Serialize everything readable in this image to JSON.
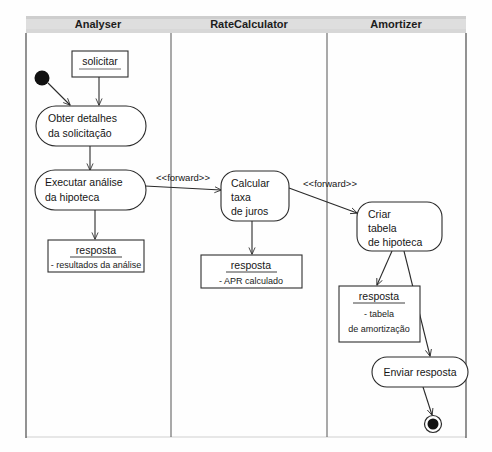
{
  "diagram": {
    "type": "uml-activity-diagram",
    "title": "",
    "language": "pt-BR",
    "lanes": [
      {
        "id": "analyser",
        "label": "Analyser",
        "x_center": 98
      },
      {
        "id": "ratecalculator",
        "label": "RateCalculator",
        "x_center": 249
      },
      {
        "id": "amortizer",
        "label": "Amortizer",
        "x_center": 396
      }
    ],
    "nodes": [
      {
        "id": "start",
        "kind": "initial-node",
        "lane": "analyser",
        "label": ""
      },
      {
        "id": "solicitar",
        "kind": "object-node",
        "lane": "analyser",
        "title": "solicitar",
        "attributes": []
      },
      {
        "id": "obter-detalhes",
        "kind": "action",
        "lane": "analyser",
        "lines": [
          "Obter detalhes",
          "da solicitação"
        ]
      },
      {
        "id": "executar-analise",
        "kind": "action",
        "lane": "analyser",
        "lines": [
          "Executar análise",
          "da hipoteca"
        ]
      },
      {
        "id": "resposta-analise",
        "kind": "object-node",
        "lane": "analyser",
        "title": "resposta",
        "attributes": [
          "- resultados da análise"
        ]
      },
      {
        "id": "calcular-taxa",
        "kind": "action",
        "lane": "ratecalculator",
        "lines": [
          "Calcular",
          "taxa",
          "de juros"
        ]
      },
      {
        "id": "resposta-apr",
        "kind": "object-node",
        "lane": "ratecalculator",
        "title": "resposta",
        "attributes": [
          "- APR calculado"
        ]
      },
      {
        "id": "criar-tabela",
        "kind": "action",
        "lane": "amortizer",
        "lines": [
          "Criar",
          "tabela",
          "de hipoteca"
        ]
      },
      {
        "id": "resposta-tabela",
        "kind": "object-node",
        "lane": "amortizer",
        "title": "resposta",
        "attributes": [
          "- tabela",
          "de amortização"
        ]
      },
      {
        "id": "enviar-resposta",
        "kind": "action",
        "lane": "amortizer",
        "lines": [
          "Enviar resposta"
        ]
      },
      {
        "id": "final",
        "kind": "final-node",
        "lane": "amortizer",
        "label": ""
      }
    ],
    "edges": [
      {
        "from": "start",
        "to": "obter-detalhes",
        "label": ""
      },
      {
        "from": "solicitar",
        "to": "obter-detalhes",
        "label": ""
      },
      {
        "from": "obter-detalhes",
        "to": "executar-analise",
        "label": ""
      },
      {
        "from": "executar-analise",
        "to": "resposta-analise",
        "label": ""
      },
      {
        "from": "executar-analise",
        "to": "calcular-taxa",
        "label": "<<forward>>"
      },
      {
        "from": "calcular-taxa",
        "to": "resposta-apr",
        "label": ""
      },
      {
        "from": "calcular-taxa",
        "to": "criar-tabela",
        "label": "<<forward>>"
      },
      {
        "from": "criar-tabela",
        "to": "resposta-tabela",
        "label": ""
      },
      {
        "from": "criar-tabela",
        "to": "enviar-resposta",
        "label": ""
      },
      {
        "from": "enviar-resposta",
        "to": "final",
        "label": ""
      }
    ],
    "stereotypes": {
      "forward_1": "<<forward>>",
      "forward_2": "<<forward>>"
    },
    "colors": {
      "stroke": "#2a2a2a",
      "header_band": "#d9d9d9",
      "background": "#fefefe",
      "text": "#161616"
    }
  }
}
